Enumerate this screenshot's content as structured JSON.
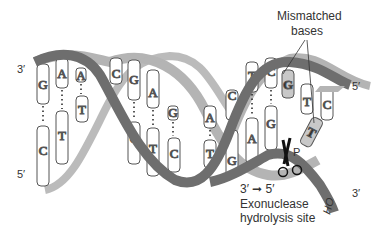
{
  "diagram": {
    "colors": {
      "strand_dark": "#6e6e6e",
      "strand_light": "#b4b4b4",
      "base_fill": "#ffffff",
      "mismatch_fill": "#c8c8c8",
      "outline": "#555555",
      "text": "#333333"
    },
    "labels": {
      "mismatched_line1": "Mismatched",
      "mismatched_line2": "bases",
      "top_left_end": "3′",
      "bottom_left_end": "5′",
      "top_right_end": "5′",
      "bottom_right_end": "3′",
      "direction": "3′ ➞ 5′",
      "site_line1": "Exonuclease",
      "site_line2": "hydrolysis site",
      "phosphate": "P",
      "hydroxyl": "HO"
    },
    "top_strand_bases": [
      "G",
      "A",
      "A",
      "C",
      "G",
      "A",
      "G",
      "A",
      "C",
      "T",
      "C",
      "G",
      "T",
      "C"
    ],
    "bottom_strand_bases": [
      "C",
      "T",
      "T",
      "C",
      "T",
      "C",
      "T",
      "G",
      "A",
      "G",
      "T"
    ],
    "mismatched_bases": [
      "G",
      "T"
    ]
  }
}
